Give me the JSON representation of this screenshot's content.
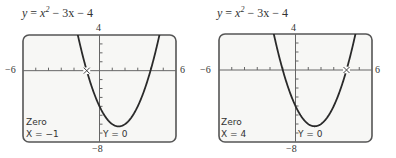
{
  "chart_data": [
    {
      "type": "line",
      "title": "y = x^2 - 3x - 4",
      "equation": {
        "lhs": "y",
        "x": "x",
        "exp": "2",
        "rest": "− 3x − 4"
      },
      "function": "x^2 - 3x - 4",
      "xlim": [
        -6,
        6
      ],
      "ylim": [
        -8,
        4
      ],
      "xtick_labels": {
        "min": "−6",
        "max": "6"
      },
      "ytick_labels": {
        "max": "4",
        "min": "−8"
      },
      "x_scale": 1,
      "y_scale": 1,
      "grid": false,
      "trace_point": {
        "x": -1,
        "y": 0
      },
      "screen_text": {
        "mode": "Zero",
        "x_readout": "X = −1",
        "y_readout": "Y = 0"
      }
    },
    {
      "type": "line",
      "title": "y = x^2 - 3x - 4",
      "equation": {
        "lhs": "y",
        "x": "x",
        "exp": "2",
        "rest": "− 3x − 4"
      },
      "function": "x^2 - 3x - 4",
      "xlim": [
        -6,
        6
      ],
      "ylim": [
        -8,
        4
      ],
      "xtick_labels": {
        "min": "−6",
        "max": "6"
      },
      "ytick_labels": {
        "max": "4",
        "min": "−8"
      },
      "x_scale": 1,
      "y_scale": 1,
      "grid": false,
      "trace_point": {
        "x": 4,
        "y": 0
      },
      "screen_text": {
        "mode": "Zero",
        "x_readout": "X = 4",
        "y_readout": "Y = 0"
      }
    }
  ],
  "colors": {
    "frame": "#555555",
    "screen_bg": "#f7f7f5",
    "curve": "#2a2a2a",
    "axis": "#666666"
  }
}
